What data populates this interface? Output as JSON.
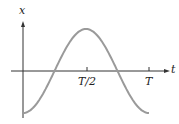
{
  "chart_data": {
    "type": "line",
    "title": "",
    "xlabel": "t",
    "ylabel": "x",
    "x_ticks": [
      "T/2",
      "T"
    ],
    "series": [
      {
        "name": "x(t) = -A cos(2πt/T)",
        "x": [
          0,
          0.25,
          0.5,
          0.75,
          1.0
        ],
        "values": [
          -1,
          0,
          1,
          0,
          -1
        ]
      }
    ],
    "xlim": [
      0,
      1.0
    ],
    "ylim": [
      -1,
      1
    ],
    "grid": false,
    "colors": {
      "curve": "#9a9a9a",
      "axes": "#333333"
    }
  },
  "labels": {
    "y_axis": "x",
    "x_axis": "t",
    "tick_half": "T/2",
    "tick_full": "T"
  }
}
